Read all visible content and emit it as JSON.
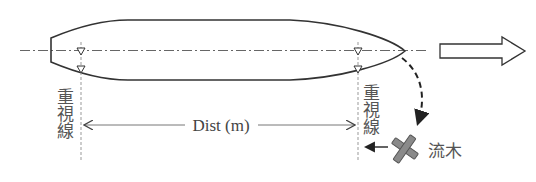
{
  "diagram": {
    "type": "ship-lookout-diagram",
    "direction_of_travel": "right",
    "labels": {
      "focus_line_left": [
        "重",
        "視",
        "線"
      ],
      "focus_line_right": [
        "重",
        "視",
        "線"
      ],
      "distance": "Dist (m)",
      "driftwood": "流木"
    },
    "colors": {
      "line": "#333333",
      "text": "#555555",
      "driftwood_fill": "#8a8a8a",
      "driftwood_stroke": "#555555",
      "dotted_line": "#999999"
    }
  }
}
